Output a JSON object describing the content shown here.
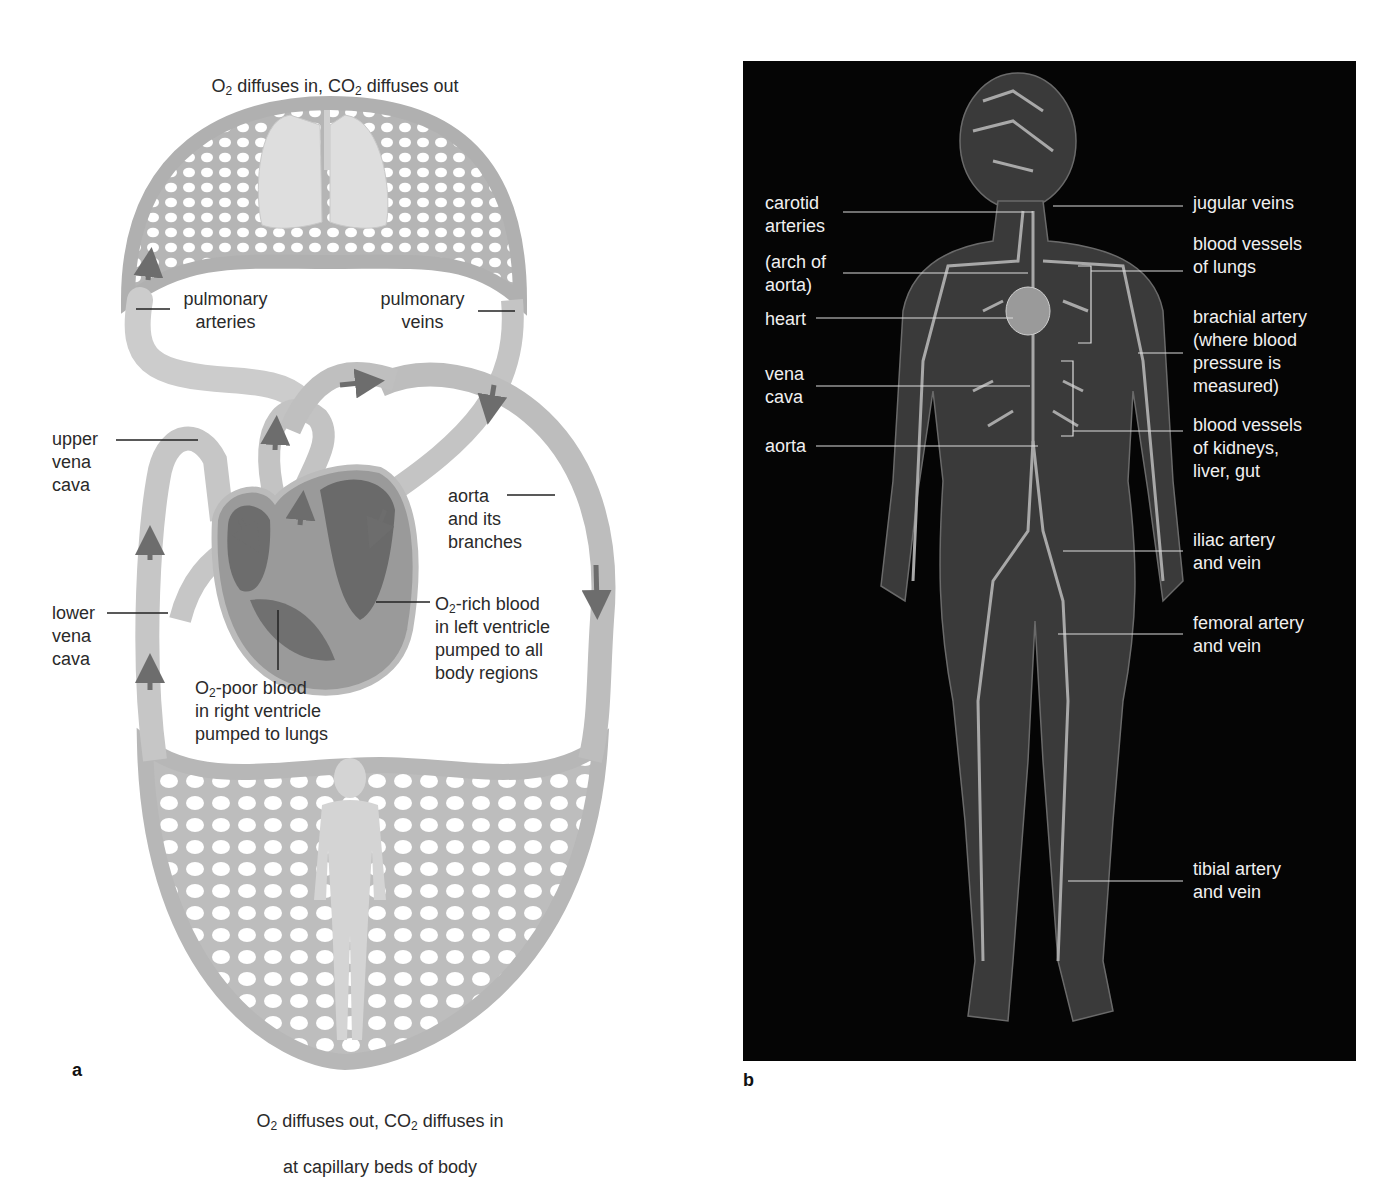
{
  "panel_a": {
    "letter": "a",
    "top_caption": {
      "line1_pre": "O",
      "line1_sub1": "2",
      "line1_mid": " diffuses in, CO",
      "line1_sub2": "2",
      "line1_post": " diffuses out",
      "line2": "at capillary beds within lungs"
    },
    "bottom_caption": {
      "line1_pre": "O",
      "line1_sub1": "2",
      "line1_mid": " diffuses out, CO",
      "line1_sub2": "2",
      "line1_post": " diffuses in",
      "line2": "at capillary beds of body"
    },
    "labels": {
      "pulmonary_arteries": "pulmonary\narteries",
      "pulmonary_veins": "pulmonary\nveins",
      "upper_vena_cava": "upper\nvena\ncava",
      "lower_vena_cava": "lower\nvena\ncava",
      "aorta": "aorta\nand its\nbranches",
      "o2_rich_pre": "O",
      "o2_rich_sub": "2",
      "o2_rich_post": "-rich blood\nin left ventricle\npumped to all\nbody regions",
      "o2_poor_pre": "O",
      "o2_poor_sub": "2",
      "o2_poor_post": "-poor blood\nin right ventricle\npumped to lungs"
    },
    "colors": {
      "vessel": "#c9c9c9",
      "vessel_dark": "#a8a8a8",
      "arrow": "#6d6d6d",
      "heart": "#8a8a8a",
      "chamber": "#6a6a6a"
    }
  },
  "panel_b": {
    "letter": "b",
    "background": "#050505",
    "labels_left": [
      "carotid\narteries",
      "(arch of\naorta)",
      "heart",
      "vena\ncava",
      "aorta"
    ],
    "labels_right": [
      "jugular veins",
      "blood vessels\nof lungs",
      "brachial artery\n(where blood\npressure is\nmeasured)",
      "blood vessels\nof kidneys,\nliver, gut",
      "iliac artery\nand vein",
      "femoral artery\nand vein",
      "tibial artery\nand vein"
    ]
  }
}
